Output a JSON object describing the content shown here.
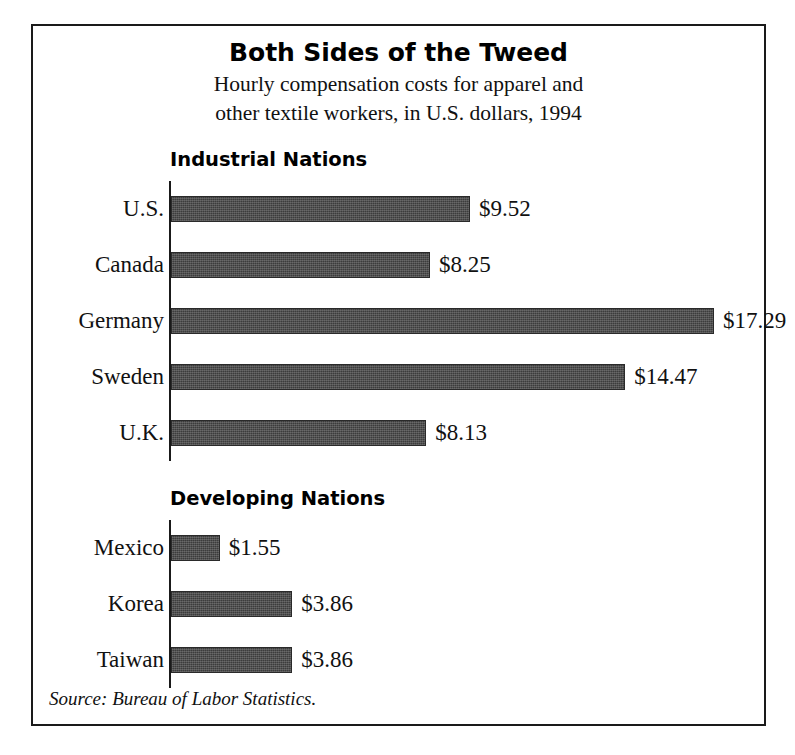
{
  "figure": {
    "title": "Both Sides of the Tweed",
    "subtitle_line1": "Hourly compensation costs for apparel and",
    "subtitle_line2": "other textile workers, in U.S. dollars, 1994",
    "source": "Source: Bureau of Labor Statistics."
  },
  "groups": [
    {
      "heading": "Industrial Nations",
      "rows": [
        {
          "label": "U.S.",
          "value": 9.52,
          "value_label": "$9.52"
        },
        {
          "label": "Canada",
          "value": 8.25,
          "value_label": "$8.25"
        },
        {
          "label": "Germany",
          "value": 17.29,
          "value_label": "$17.29"
        },
        {
          "label": "Sweden",
          "value": 14.47,
          "value_label": "$14.47"
        },
        {
          "label": "U.K.",
          "value": 8.13,
          "value_label": "$8.13"
        }
      ]
    },
    {
      "heading": "Developing Nations",
      "rows": [
        {
          "label": "Mexico",
          "value": 1.55,
          "value_label": "$1.55"
        },
        {
          "label": "Korea",
          "value": 3.86,
          "value_label": "$3.86"
        },
        {
          "label": "Taiwan",
          "value": 3.86,
          "value_label": "$3.86"
        }
      ]
    }
  ],
  "chart_data": {
    "type": "bar",
    "orientation": "horizontal",
    "title": "Both Sides of the Tweed",
    "subtitle": "Hourly compensation costs for apparel and other textile workers, in U.S. dollars, 1994",
    "xlabel": "",
    "ylabel": "",
    "unit": "U.S. dollars per hour",
    "year": 1994,
    "grid": false,
    "legend": false,
    "px_per_unit": 31.4,
    "xlim": [
      0,
      17.29
    ],
    "categories": [
      "U.S.",
      "Canada",
      "Germany",
      "Sweden",
      "U.K.",
      "Mexico",
      "Korea",
      "Taiwan"
    ],
    "values": [
      9.52,
      8.25,
      17.29,
      14.47,
      8.13,
      1.55,
      3.86,
      3.86
    ],
    "groups": [
      {
        "name": "Industrial Nations",
        "categories": [
          "U.S.",
          "Canada",
          "Germany",
          "Sweden",
          "U.K."
        ],
        "values": [
          9.52,
          8.25,
          17.29,
          14.47,
          8.13
        ]
      },
      {
        "name": "Developing Nations",
        "categories": [
          "Mexico",
          "Korea",
          "Taiwan"
        ],
        "values": [
          1.55,
          3.86,
          3.86
        ]
      }
    ],
    "data_labels": [
      "$9.52",
      "$8.25",
      "$17.29",
      "$14.47",
      "$8.13",
      "$1.55",
      "$3.86",
      "$3.86"
    ],
    "bar_color": "#3c3c3c",
    "source": "Source: Bureau of Labor Statistics."
  }
}
